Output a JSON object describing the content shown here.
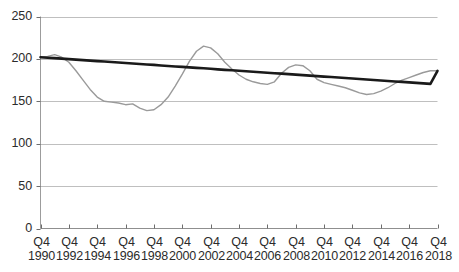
{
  "chart_data": {
    "type": "line",
    "title": "",
    "subtitle": "",
    "xlabel": "",
    "ylabel": "",
    "ylim": [
      0,
      250
    ],
    "yticks": [
      0,
      50,
      100,
      150,
      200,
      250
    ],
    "grid": true,
    "grid_axis": "y",
    "legend": "none",
    "x_tick_labels": [
      {
        "quarter": "Q4",
        "year": "1990"
      },
      {
        "quarter": "Q4",
        "year": "1992"
      },
      {
        "quarter": "Q4",
        "year": "1994"
      },
      {
        "quarter": "Q4",
        "year": "1996"
      },
      {
        "quarter": "Q4",
        "year": "1998"
      },
      {
        "quarter": "Q4",
        "year": "2000"
      },
      {
        "quarter": "Q4",
        "year": "2002"
      },
      {
        "quarter": "Q4",
        "year": "2004"
      },
      {
        "quarter": "Q4",
        "year": "2006"
      },
      {
        "quarter": "Q4",
        "year": "2008"
      },
      {
        "quarter": "Q4",
        "year": "2010"
      },
      {
        "quarter": "Q4",
        "year": "2012"
      },
      {
        "quarter": "Q4",
        "year": "2014"
      },
      {
        "quarter": "Q4",
        "year": "2016"
      },
      {
        "quarter": "Q4",
        "year": "2018"
      }
    ],
    "x": [
      1990.0,
      1990.5,
      1991.0,
      1991.5,
      1992.0,
      1992.5,
      1993.0,
      1993.5,
      1994.0,
      1994.5,
      1995.0,
      1995.5,
      1996.0,
      1996.5,
      1997.0,
      1997.5,
      1998.0,
      1998.5,
      1999.0,
      1999.5,
      2000.0,
      2000.5,
      2001.0,
      2001.5,
      2002.0,
      2002.5,
      2003.0,
      2003.5,
      2004.0,
      2004.5,
      2005.0,
      2005.5,
      2006.0,
      2006.5,
      2007.0,
      2007.5,
      2008.0,
      2008.5,
      2009.0,
      2009.5,
      2010.0,
      2010.5,
      2011.0,
      2011.5,
      2012.0,
      2012.5,
      2013.0,
      2013.5,
      2014.0,
      2014.5,
      2015.0,
      2015.5,
      2016.0,
      2016.5,
      2017.0,
      2017.5,
      2018.0
    ],
    "series": [
      {
        "name": "Index",
        "color": "#9a9a9a",
        "width": 1.4,
        "values": [
          202,
          203,
          205,
          202,
          196,
          186,
          175,
          164,
          155,
          150,
          149,
          148,
          146,
          147,
          142,
          139,
          140,
          146,
          155,
          168,
          182,
          197,
          209,
          215,
          213,
          206,
          196,
          188,
          181,
          176,
          173,
          171,
          170,
          173,
          183,
          190,
          193,
          192,
          186,
          176,
          172,
          170,
          168,
          166,
          163,
          160,
          158,
          159,
          162,
          166,
          171,
          175,
          178,
          181,
          184,
          186,
          186
        ]
      },
      {
        "name": "Trend",
        "color": "#1a1a1a",
        "width": 2.6,
        "values": [
          202.0,
          201.4,
          200.9,
          200.3,
          199.7,
          199.1,
          198.6,
          198.0,
          197.4,
          196.9,
          196.3,
          195.7,
          195.1,
          194.6,
          194.0,
          193.4,
          192.9,
          192.3,
          191.7,
          191.1,
          190.6,
          190.0,
          189.4,
          188.9,
          188.3,
          187.7,
          187.1,
          186.6,
          186.0,
          185.4,
          184.9,
          184.3,
          183.7,
          183.1,
          182.6,
          182.0,
          181.4,
          180.9,
          180.3,
          179.7,
          179.1,
          178.6,
          178.0,
          177.4,
          176.9,
          176.3,
          175.7,
          175.1,
          174.6,
          174.0,
          173.4,
          172.9,
          172.3,
          171.7,
          171.1,
          170.6,
          186.0
        ]
      }
    ],
    "annotations": []
  },
  "axes": {
    "y_label_0": "0",
    "y_label_50": "50",
    "y_label_100": "100",
    "y_label_150": "150",
    "y_label_200": "200",
    "y_label_250": "250"
  }
}
